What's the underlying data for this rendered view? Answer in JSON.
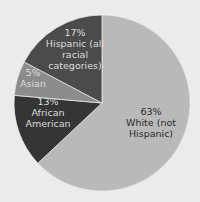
{
  "chart_data": {
    "type": "pie",
    "title": "",
    "start_angle_deg": 0,
    "direction": "clockwise",
    "slices": [
      {
        "name": "White (not Hispanic)",
        "value": 63,
        "label": "63%",
        "text": "White (not\nHispanic)",
        "color": "#b9b9b9",
        "start": 0,
        "end": 226.8,
        "text_style": "light"
      },
      {
        "name": "African American",
        "value": 13,
        "label": "13%",
        "text": "African\nAmerican",
        "color": "#353535",
        "start": 226.8,
        "end": 275,
        "text_style": "dark"
      },
      {
        "name": "Asian",
        "value": 5,
        "label": "5%",
        "text": "Asian",
        "color": "#8c8c8c",
        "start": 275,
        "end": 297.8,
        "text_style": "dark"
      },
      {
        "name": "Hispanic (all racial categories)",
        "value": 17,
        "label": "17%",
        "text": "Hispanic (all\nracial\ncategories)",
        "color": "#4b4b4b",
        "start": 297.8,
        "end": 360,
        "text_style": "dark"
      }
    ],
    "center": [
      102,
      103
    ],
    "radius": 88,
    "background": "#ebebeb"
  },
  "labels": [
    {
      "id": "white",
      "text": "63%\nWhite (not\nHispanic)",
      "x": 121,
      "y": 106,
      "w": 60,
      "style": "light"
    },
    {
      "id": "african-american",
      "text": "13%\nAfrican\nAmerican",
      "x": 22,
      "y": 96,
      "w": 52,
      "style": "dark"
    },
    {
      "id": "asian",
      "text": "5%\nAsian",
      "x": 16,
      "y": 67,
      "w": 34,
      "style": "dark"
    },
    {
      "id": "hispanic",
      "text": "17%\nHispanic (all\nracial\ncategories)",
      "x": 44,
      "y": 27,
      "w": 62,
      "style": "dark"
    }
  ]
}
